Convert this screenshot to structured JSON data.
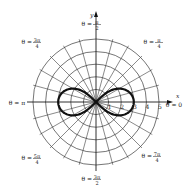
{
  "chart_data": {
    "type": "polar-curve",
    "title": "",
    "equation": "r^2 = 9 cos(2θ)",
    "curve": {
      "name": "lemniscate",
      "a": 3,
      "color": "#111111"
    },
    "axes": {
      "x_label": "x",
      "y_label": "y",
      "radial_ticks": [
        "1",
        "2",
        "3",
        "4",
        "5"
      ],
      "r_max": 5
    },
    "grid": {
      "circles": [
        1,
        2,
        3,
        4,
        5
      ],
      "ray_step_deg": 15
    },
    "angle_labels": [
      {
        "id": "theta-0",
        "prefix": "θ = ",
        "num": "0",
        "den": "",
        "angle_deg": 0
      },
      {
        "id": "theta-pi-4",
        "prefix": "θ = ",
        "num": "π",
        "den": "4",
        "angle_deg": 45
      },
      {
        "id": "theta-pi-2",
        "prefix": "θ = ",
        "num": "π",
        "den": "2",
        "angle_deg": 90
      },
      {
        "id": "theta-3pi-4",
        "prefix": "θ = ",
        "num": "3π",
        "den": "4",
        "angle_deg": 135
      },
      {
        "id": "theta-pi",
        "prefix": "θ = ",
        "num": "π",
        "den": "",
        "angle_deg": 180
      },
      {
        "id": "theta-5pi-4",
        "prefix": "θ = ",
        "num": "5π",
        "den": "4",
        "angle_deg": 225
      },
      {
        "id": "theta-3pi-2",
        "prefix": "θ = ",
        "num": "3π",
        "den": "2",
        "angle_deg": 270
      },
      {
        "id": "theta-7pi-4",
        "prefix": "θ = ",
        "num": "7π",
        "den": "4",
        "angle_deg": 315
      }
    ]
  },
  "layout": {
    "cx": 96,
    "cy": 102,
    "unit_px": 12.6
  }
}
